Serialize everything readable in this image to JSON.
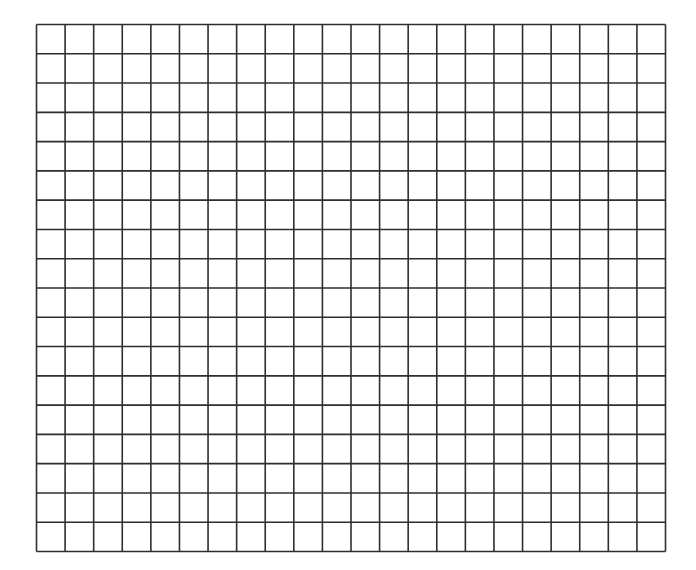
{
  "grid": {
    "columns": 22,
    "rows": 18,
    "left": 36.5,
    "top": 24.5,
    "right": 665.5,
    "bottom": 551.5,
    "line_color": "#2e2e2e",
    "line_width": 1.6,
    "background": "#ffffff"
  }
}
